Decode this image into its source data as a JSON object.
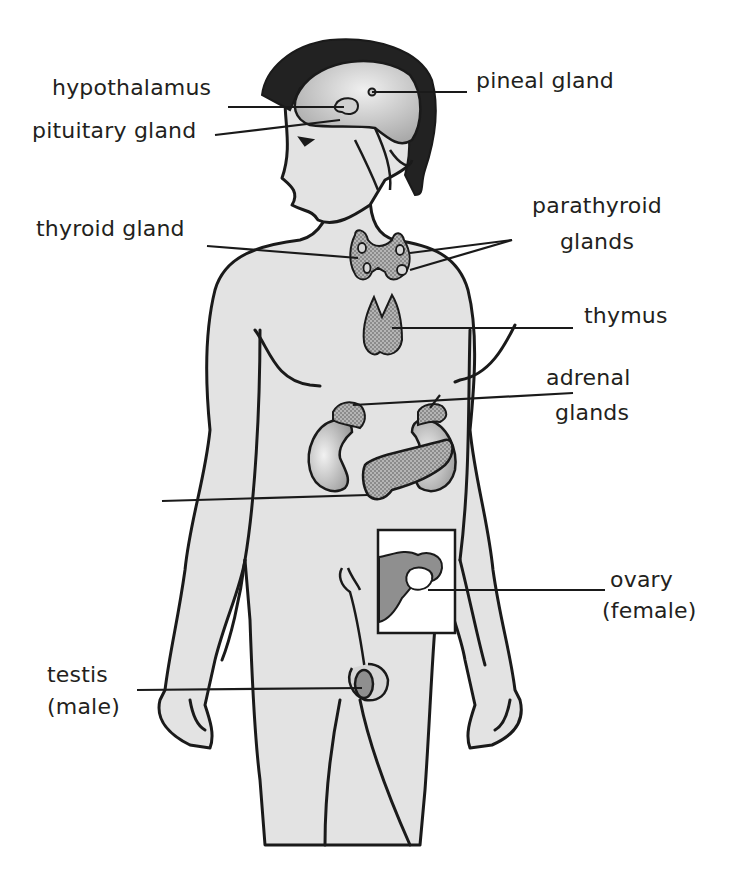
{
  "diagram": {
    "colors": {
      "background": "#ffffff",
      "body_fill": "#e3e3e3",
      "outline": "#1a1a1a",
      "hair": "#222222",
      "brain": "#c9c9c9",
      "gland_fill": "#a9a9a9",
      "kidney_fill": "#bdbdbd",
      "inset_box": "#ffffff",
      "label_text": "#231f20"
    },
    "labels": {
      "hypothalamus": "hypothalamus",
      "pituitary": "pituitary gland",
      "pineal": "pineal gland",
      "thyroid": "thyroid gland",
      "parathyroid_1": "parathyroid",
      "parathyroid_2": "glands",
      "thymus": "thymus",
      "adrenal_1": "adrenal",
      "adrenal_2": "glands",
      "pancreas": "",
      "ovary_1": "ovary",
      "ovary_2": "(female)",
      "testis_1": "testis",
      "testis_2": "(male)"
    }
  }
}
